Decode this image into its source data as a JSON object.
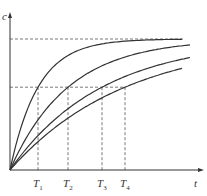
{
  "axes": {
    "y_label": "c",
    "x_label": "t"
  },
  "ticks": [
    {
      "name": "T",
      "sub": "1"
    },
    {
      "name": "T",
      "sub": "2"
    },
    {
      "name": "T",
      "sub": "3"
    },
    {
      "name": "T",
      "sub": "4"
    }
  ],
  "chart_data": {
    "type": "line",
    "title": "",
    "xlabel": "t",
    "ylabel": "c",
    "x_ticks": [
      "T1",
      "T2",
      "T3",
      "T4"
    ],
    "x_tick_relative_positions": [
      28,
      58,
      92,
      115
    ],
    "series": [
      {
        "name": "curve-1",
        "time_constant": "T1"
      },
      {
        "name": "curve-2",
        "time_constant": "T2"
      },
      {
        "name": "curve-3",
        "time_constant": "T3"
      },
      {
        "name": "curve-4",
        "time_constant": "T4"
      }
    ],
    "guides": [
      {
        "level": "c_inf",
        "style": "dashed"
      },
      {
        "level": "0.63 c_inf",
        "style": "dashed"
      }
    ],
    "grid": false
  }
}
